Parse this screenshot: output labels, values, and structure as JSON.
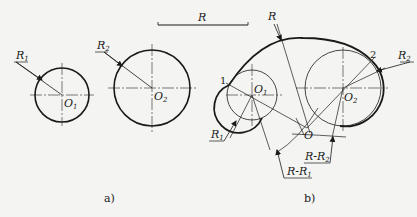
{
  "figure": {
    "background": "#f4f4f2",
    "ink": "#1a1a1a",
    "reference_length": {
      "label": "R"
    },
    "panel_a": {
      "caption": "a)",
      "circle1": {
        "center_label": "O",
        "center_sub": "1",
        "radius_label": "R",
        "radius_sub": "1"
      },
      "circle2": {
        "center_label": "O",
        "center_sub": "2",
        "radius_label": "R",
        "radius_sub": "2"
      }
    },
    "panel_b": {
      "caption": "b)",
      "arc_label": "R",
      "tangent_point_1": "1",
      "tangent_point_2": "2",
      "center_o": "O",
      "circle1": {
        "center_label": "O",
        "center_sub": "1",
        "radius_label": "R",
        "radius_sub": "1"
      },
      "circle2": {
        "center_label": "O",
        "center_sub": "2",
        "radius_label": "R",
        "radius_sub": "2"
      },
      "construction_arc_1": {
        "label": "R-R",
        "sub": "1"
      },
      "construction_arc_2": {
        "label": "R-R",
        "sub": "2"
      }
    }
  }
}
